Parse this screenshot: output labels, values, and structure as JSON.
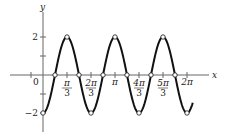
{
  "chart_data": {
    "type": "line",
    "title": "",
    "function": "y = -2 cos(3x)",
    "xlabel": "x",
    "ylabel": "y",
    "xlim": [
      -0.5,
      2.2
    ],
    "xlim_units": "multiples of pi",
    "ylim": [
      -3,
      3
    ],
    "grid": false,
    "legend": "none",
    "x_ticks": [
      {
        "value": -0.1667,
        "label": ""
      },
      {
        "value": 0.3333,
        "label_num": "π",
        "label_den": "3"
      },
      {
        "value": 0.6667,
        "label_num": "2π",
        "label_den": "3"
      },
      {
        "value": 1.0,
        "label": "π"
      },
      {
        "value": 1.3333,
        "label_num": "4π",
        "label_den": "3"
      },
      {
        "value": 1.6667,
        "label_num": "5π",
        "label_den": "3"
      },
      {
        "value": 2.0,
        "label": "2π"
      }
    ],
    "origin_label": "0",
    "y_ticks": [
      {
        "value": 2,
        "label": "2"
      },
      {
        "value": 1,
        "label": ""
      },
      {
        "value": -1,
        "label": ""
      },
      {
        "value": -2,
        "label": "−2"
      }
    ],
    "series": [
      {
        "name": "y = -2cos(3x)",
        "x_range_pi": [
          0,
          2.08
        ],
        "marked_points": [
          {
            "x_pi": 0,
            "y": -2
          },
          {
            "x_pi": 0.1667,
            "y": 0
          },
          {
            "x_pi": 0.3333,
            "y": 2
          },
          {
            "x_pi": 0.5,
            "y": 0
          },
          {
            "x_pi": 0.6667,
            "y": -2
          },
          {
            "x_pi": 0.8333,
            "y": 0
          },
          {
            "x_pi": 1.0,
            "y": 2
          },
          {
            "x_pi": 1.1667,
            "y": 0
          },
          {
            "x_pi": 1.3333,
            "y": -2
          },
          {
            "x_pi": 1.5,
            "y": 0
          },
          {
            "x_pi": 1.6667,
            "y": 2
          },
          {
            "x_pi": 1.8333,
            "y": 0
          },
          {
            "x_pi": 2.0,
            "y": -2
          }
        ]
      }
    ]
  }
}
